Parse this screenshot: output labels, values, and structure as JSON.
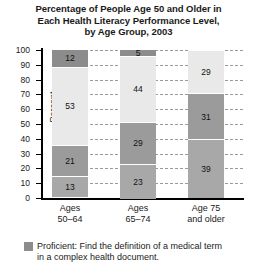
{
  "chart_data": {
    "type": "bar",
    "subtype": "stacked-100-percent",
    "title": "Percentage of People Age 50 and Older in Each Health Literacy Performance Level, by Age Group, 2003",
    "title_lines": [
      "Percentage of People Age 50 and Older in",
      "Each Health Literacy Performance Level,",
      "by Age Group, 2003"
    ],
    "xlabel": "",
    "ylabel": "Percent",
    "ylim": [
      0,
      100
    ],
    "ytick_step": 10,
    "yticks": [
      "100",
      "90",
      "80",
      "70",
      "60",
      "50",
      "40",
      "30",
      "20",
      "10",
      "0"
    ],
    "grid": true,
    "legend_position": "below",
    "categories": [
      "Ages 50–64",
      "Ages 65–74",
      "Age 75 and older"
    ],
    "category_lines": [
      [
        "Ages",
        "50–64"
      ],
      [
        "Ages",
        "65–74"
      ],
      [
        "Age 75",
        "and older"
      ]
    ],
    "series": [
      {
        "name": "Below Basic",
        "color": "#8c8c8c",
        "values": [
          12,
          5,
          1
        ],
        "labels": [
          "12",
          "5",
          "1"
        ]
      },
      {
        "name": "Basic",
        "color": "#e9e9e9",
        "values": [
          53,
          44,
          29
        ],
        "labels": [
          "53",
          "44",
          "29"
        ]
      },
      {
        "name": "Intermediate",
        "color": "#9b9b9b",
        "values": [
          21,
          29,
          31
        ],
        "labels": [
          "21",
          "29",
          "31"
        ]
      },
      {
        "name": "Proficient",
        "color": "#a8a8a8",
        "values": [
          13,
          23,
          39
        ],
        "labels": [
          "13",
          "23",
          "39"
        ]
      }
    ],
    "stack_order_top_to_bottom": [
      "Below Basic",
      "Basic",
      "Intermediate",
      "Proficient"
    ]
  },
  "legend": {
    "items": [
      {
        "swatch_color": "#8c8c8c",
        "lines": [
          "Proficient: Find the definition of a medical term",
          "in a complex health document."
        ]
      }
    ]
  },
  "colors": {
    "axis": "#000000",
    "gridline": "#9a9a9a",
    "background": "#ffffff",
    "text": "#1a1a1a"
  }
}
